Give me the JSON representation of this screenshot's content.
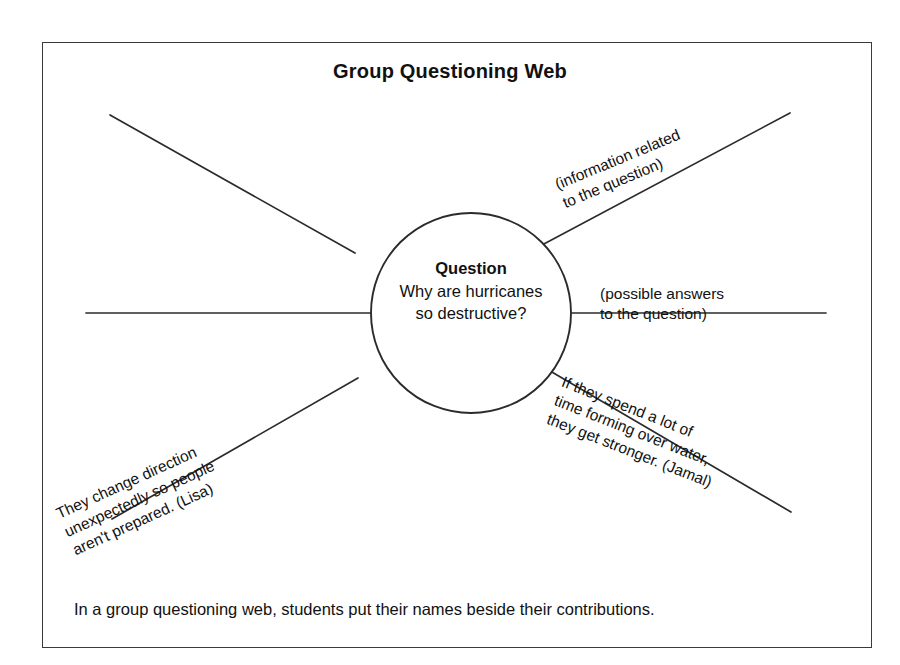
{
  "title": "Group Questioning Web",
  "center": {
    "heading": "Question",
    "line1": "Why are hurricanes",
    "line2": "so destructive?"
  },
  "spokes": [
    {
      "id": "upper-left",
      "name": "spoke-upper-left",
      "label": "",
      "x1": 355,
      "y1": 253,
      "x2": 110,
      "y2": 115
    },
    {
      "id": "upper-right",
      "name": "spoke-upper-right",
      "label": "(information related\nto the question)",
      "label_line1": "(information related",
      "label_line2": "to the question)",
      "x1": 542,
      "y1": 245,
      "x2": 790,
      "y2": 113
    },
    {
      "id": "left",
      "name": "spoke-left",
      "label": "",
      "x1": 371,
      "y1": 313,
      "x2": 86,
      "y2": 313
    },
    {
      "id": "right",
      "name": "spoke-right",
      "label_line1": "(possible answers",
      "label_line2": "to the question)",
      "x1": 572,
      "y1": 313,
      "x2": 826,
      "y2": 313
    },
    {
      "id": "lower-left",
      "name": "spoke-lower-left",
      "label_line1": "They change direction",
      "label_line2": "unexpectedly so people",
      "label_line3": "aren't prepared. (Lisa)",
      "x1": 358,
      "y1": 378,
      "x2": 112,
      "y2": 519
    },
    {
      "id": "lower-right",
      "name": "spoke-lower-right",
      "label_line1": "If they spend a lot of",
      "label_line2": "time forming over water,",
      "label_line3": "they get stronger. (Jamal)",
      "x1": 545,
      "y1": 368,
      "x2": 791,
      "y2": 512
    }
  ],
  "caption": "In a group questioning web, students put their names beside their contributions.",
  "geometry": {
    "circle_cx": 471,
    "circle_cy": 313,
    "circle_r": 100,
    "stroke": "#2b2b2b",
    "frame_stroke": "#3a3a3a"
  }
}
